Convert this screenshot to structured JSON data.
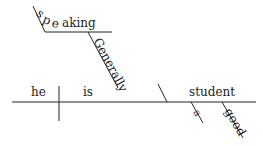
{
  "diagram": {
    "type": "reed-kellogg sentence diagram",
    "subject": "he",
    "verb": "is",
    "complement": "student",
    "modifiers": {
      "complement": [
        "a",
        "good"
      ],
      "verb": "Generally",
      "participle": "speaking"
    },
    "participle_letters": [
      "s",
      "p",
      "e",
      "aking"
    ]
  },
  "colors": {
    "line": "#222222",
    "text": "#222222",
    "background": "#ffffff"
  }
}
